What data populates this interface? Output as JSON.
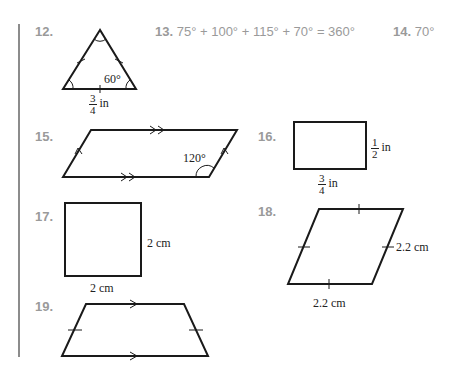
{
  "problems": {
    "p12": {
      "number": "12.",
      "angle_label": "60°",
      "side": {
        "numerator": "3",
        "denominator": "4",
        "unit": "in"
      }
    },
    "p13": {
      "number": "13.",
      "answer": "75° + 100° + 115° + 70° = 360°"
    },
    "p14": {
      "number": "14.",
      "answer": "70°"
    },
    "p15": {
      "number": "15.",
      "angle_label": "120°"
    },
    "p16": {
      "number": "16.",
      "height": {
        "numerator": "1",
        "denominator": "2",
        "unit": "in"
      },
      "width": {
        "numerator": "3",
        "denominator": "4",
        "unit": "in"
      }
    },
    "p17": {
      "number": "17.",
      "side_label": "2 cm",
      "bottom_label": "2 cm"
    },
    "p18": {
      "number": "18.",
      "side_label": "2.2 cm",
      "bottom_label": "2.2 cm"
    },
    "p19": {
      "number": "19."
    }
  },
  "colors": {
    "number_text": "#9a9a9a",
    "figure_stroke": "#1a1a1a",
    "rule": "#8c8c8c"
  }
}
